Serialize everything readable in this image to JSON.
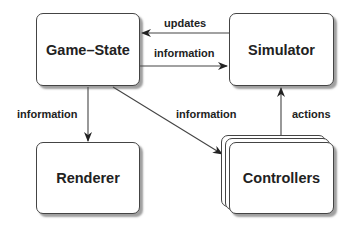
{
  "diagram": {
    "nodes": [
      {
        "id": "game-state",
        "label": "Game–State"
      },
      {
        "id": "simulator",
        "label": "Simulator"
      },
      {
        "id": "renderer",
        "label": "Renderer"
      },
      {
        "id": "controllers",
        "label": "Controllers",
        "stacked": true
      }
    ],
    "edges": [
      {
        "from": "simulator",
        "to": "game-state",
        "label": "updates"
      },
      {
        "from": "game-state",
        "to": "simulator",
        "label": "information"
      },
      {
        "from": "game-state",
        "to": "renderer",
        "label": "information"
      },
      {
        "from": "game-state",
        "to": "controllers",
        "label": "information"
      },
      {
        "from": "controllers",
        "to": "simulator",
        "label": "actions"
      }
    ]
  }
}
